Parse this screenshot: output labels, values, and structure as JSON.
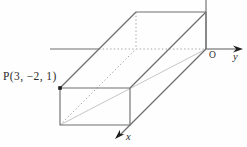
{
  "figure": {
    "type": "3d-rectangular-box-diagram",
    "point": {
      "label": "P(3, −2, 1)",
      "name": "P",
      "coords": [
        3,
        -2,
        1
      ]
    },
    "origin": {
      "label": "O"
    },
    "axes": {
      "x_label": "x",
      "y_label": "y"
    }
  },
  "colors": {
    "background": "#fefefe",
    "edge": "#6f6f6f",
    "hidden_edge": "#a6a6a6",
    "face_diagonal": "#bfbfbf",
    "arrow": "#1e1e1e",
    "text": "#2b2b2b"
  }
}
